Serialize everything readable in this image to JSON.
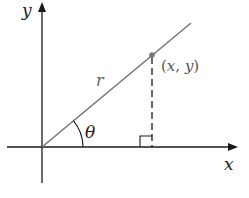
{
  "diagram": {
    "type": "polar-coordinates",
    "labels": {
      "y_axis": "y",
      "x_axis": "x",
      "radius": "r",
      "angle": "θ",
      "point": "(x, y)"
    },
    "colors": {
      "axes": "#1a1a1a",
      "ray": "#777777",
      "point": "#777777",
      "dashed": "#1a1a1a",
      "point_label": "#555555"
    }
  }
}
